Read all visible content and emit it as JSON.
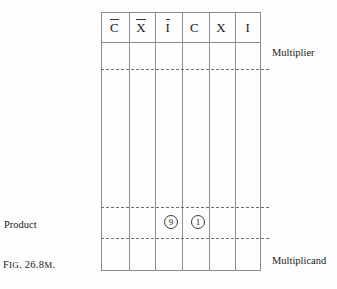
{
  "figure": {
    "caption_lead": "F",
    "caption_rest": "IG",
    "caption_number": ". 26.8",
    "caption_suffix": "M",
    "caption_end": ".",
    "caption_full": "Fig. 26.8m."
  },
  "table": {
    "columns": [
      {
        "id": "c-bar",
        "label": "C",
        "overline": true
      },
      {
        "id": "x-bar",
        "label": "X",
        "overline": true
      },
      {
        "id": "i-bar",
        "label": "I",
        "overline": true
      },
      {
        "id": "c",
        "label": "C",
        "overline": false
      },
      {
        "id": "x",
        "label": "X",
        "overline": false
      },
      {
        "id": "i",
        "label": "I",
        "overline": false
      }
    ],
    "marks": [
      {
        "column": "i-bar",
        "value": "9"
      },
      {
        "column": "c",
        "value": "1"
      }
    ]
  },
  "annotations": {
    "multiplier": "Multiplier",
    "multiplicand": "Multiplicand",
    "product": "Product"
  },
  "colors": {
    "background": "#fdfdfd",
    "rule": "#8c8c8c",
    "dashed": "#6f6f6f",
    "text": "#1a1a1a"
  }
}
